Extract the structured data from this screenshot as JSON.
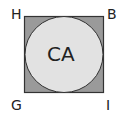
{
  "diagram": {
    "corners": {
      "top_left": "H",
      "top_right": "B",
      "bottom_left": "G",
      "bottom_right": "I"
    },
    "circle_label": "CA",
    "colors": {
      "square_fill": "#9a9a9a",
      "circle_fill": "#e2e2e2",
      "stroke": "#333333",
      "text": "#222222"
    }
  }
}
